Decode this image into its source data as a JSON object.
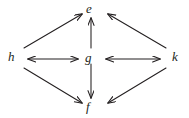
{
  "diagram": {
    "background_color": "#ffffff",
    "stroke_color": "#231f20",
    "nodes": [
      {
        "id": "e",
        "label": "e",
        "position": "top-center"
      },
      {
        "id": "g",
        "label": "g",
        "position": "center"
      },
      {
        "id": "f",
        "label": "f",
        "position": "bottom-center"
      },
      {
        "id": "h",
        "label": "h",
        "position": "left"
      },
      {
        "id": "k",
        "label": "k",
        "position": "right"
      }
    ],
    "edges": [
      {
        "from": "h",
        "to": "e",
        "style": "single-arrow"
      },
      {
        "from": "h",
        "to": "f",
        "style": "single-arrow"
      },
      {
        "from": "k",
        "to": "e",
        "style": "single-arrow"
      },
      {
        "from": "k",
        "to": "f",
        "style": "single-arrow"
      },
      {
        "from": "g",
        "to": "e",
        "style": "single-arrow"
      },
      {
        "from": "g",
        "to": "f",
        "style": "single-arrow"
      },
      {
        "from": "h",
        "to": "g",
        "style": "double-arrow"
      },
      {
        "from": "g",
        "to": "k",
        "style": "double-arrow"
      }
    ]
  }
}
